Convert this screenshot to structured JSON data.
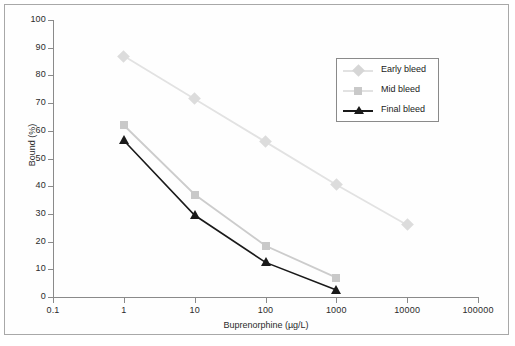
{
  "chart_data": {
    "type": "line",
    "title": "",
    "xlabel": "Buprenorphine (µg/L)",
    "ylabel": "Bound (%)",
    "xscale": "log",
    "xlim": [
      0.1,
      100000
    ],
    "ylim": [
      0,
      100
    ],
    "xticks": [
      "0.1",
      "1",
      "10",
      "100",
      "1000",
      "10000",
      "100000"
    ],
    "yticks": [
      "0",
      "10",
      "20",
      "30",
      "40",
      "50",
      "60",
      "70",
      "80",
      "90",
      "100"
    ],
    "grid": false,
    "legend_position": "upper right",
    "series": [
      {
        "name": "Early bleed",
        "marker": "diamond",
        "color": "#e2e2e2",
        "x": [
          1,
          10,
          100,
          1000,
          10000
        ],
        "values": [
          87,
          71.5,
          56,
          40.5,
          26
        ]
      },
      {
        "name": "Mid bleed",
        "marker": "square",
        "color": "#cccccc",
        "x": [
          1,
          10,
          100,
          1000
        ],
        "values": [
          62,
          37,
          18.5,
          7
        ]
      },
      {
        "name": "Final bleed",
        "marker": "triangle",
        "color": "#1a1a1a",
        "x": [
          1,
          10,
          100,
          1000
        ],
        "values": [
          56.5,
          29.5,
          12.5,
          2.5
        ]
      }
    ]
  },
  "legend": {
    "items": [
      {
        "label": "Early bleed"
      },
      {
        "label": "Mid bleed"
      },
      {
        "label": "Final bleed"
      }
    ]
  },
  "axes": {
    "x_title": "Buprenorphine (µg/L)",
    "y_title": "Bound (%)"
  },
  "colors": {
    "early": "#e2e2e2",
    "mid": "#cccccc",
    "final": "#1a1a1a",
    "axis": "#8a8a8a",
    "frame": "#a8a8a8",
    "text": "#2b2b2b",
    "background": "#ffffff"
  }
}
